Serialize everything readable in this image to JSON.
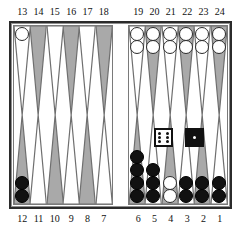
{
  "board": {
    "title": "Backgammon Board",
    "frame_color": "#2b2b2b",
    "surface_color": "#ffffff",
    "point_light_color": "#ffffff",
    "point_dark_color": "#a9a9a9",
    "white_checker_color": "#ffffff",
    "black_checker_color": "#111111",
    "labels": {
      "top_left": [
        "13",
        "14",
        "15",
        "16",
        "17",
        "18"
      ],
      "top_right": [
        "19",
        "20",
        "21",
        "22",
        "23",
        "24"
      ],
      "bottom_left": [
        "12",
        "11",
        "10",
        "9",
        "8",
        "7"
      ],
      "bottom_right": [
        "6",
        "5",
        "4",
        "3",
        "2",
        "1"
      ]
    },
    "quadrants": {
      "top_left": [
        {
          "point": "13",
          "shade": "light",
          "checkers": 1,
          "color": "white"
        },
        {
          "point": "14",
          "shade": "dark",
          "checkers": 0,
          "color": "none"
        },
        {
          "point": "15",
          "shade": "light",
          "checkers": 0,
          "color": "none"
        },
        {
          "point": "16",
          "shade": "dark",
          "checkers": 0,
          "color": "none"
        },
        {
          "point": "17",
          "shade": "light",
          "checkers": 0,
          "color": "none"
        },
        {
          "point": "18",
          "shade": "dark",
          "checkers": 0,
          "color": "none"
        }
      ],
      "top_right": [
        {
          "point": "19",
          "shade": "light",
          "checkers": 2,
          "color": "white"
        },
        {
          "point": "20",
          "shade": "dark",
          "checkers": 2,
          "color": "white"
        },
        {
          "point": "21",
          "shade": "light",
          "checkers": 2,
          "color": "white"
        },
        {
          "point": "22",
          "shade": "dark",
          "checkers": 2,
          "color": "white"
        },
        {
          "point": "23",
          "shade": "light",
          "checkers": 2,
          "color": "white"
        },
        {
          "point": "24",
          "shade": "dark",
          "checkers": 2,
          "color": "white"
        }
      ],
      "bottom_left": [
        {
          "point": "12",
          "shade": "dark",
          "checkers": 2,
          "color": "black"
        },
        {
          "point": "11",
          "shade": "light",
          "checkers": 0,
          "color": "none"
        },
        {
          "point": "10",
          "shade": "dark",
          "checkers": 0,
          "color": "none"
        },
        {
          "point": "9",
          "shade": "light",
          "checkers": 0,
          "color": "none"
        },
        {
          "point": "8",
          "shade": "dark",
          "checkers": 0,
          "color": "none"
        },
        {
          "point": "7",
          "shade": "light",
          "checkers": 0,
          "color": "none"
        }
      ],
      "bottom_right": [
        {
          "point": "6",
          "shade": "dark",
          "checkers": 4,
          "color": "black"
        },
        {
          "point": "5",
          "shade": "light",
          "checkers": 3,
          "color": "black"
        },
        {
          "point": "4",
          "shade": "dark",
          "checkers": 2,
          "color": "white"
        },
        {
          "point": "3",
          "shade": "light",
          "checkers": 2,
          "color": "black"
        },
        {
          "point": "2",
          "shade": "dark",
          "checkers": 2,
          "color": "black"
        },
        {
          "point": "1",
          "shade": "light",
          "checkers": 2,
          "color": "black"
        }
      ]
    },
    "dice": [
      {
        "name": "white-die",
        "style": "white",
        "value": 6
      },
      {
        "name": "black-die",
        "style": "black",
        "value": 1
      }
    ]
  }
}
